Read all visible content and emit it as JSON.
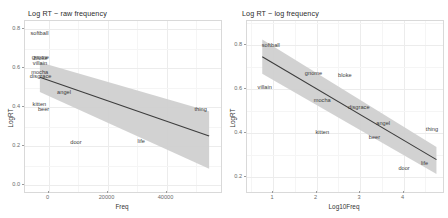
{
  "figure": {
    "background": "#ffffff",
    "ribbon_color": "#d0d0d0",
    "line_color": "#3d3d3d",
    "grid_color": "#ececec"
  },
  "chart_data": [
    {
      "type": "scatter",
      "panel": "left",
      "title": "Log RT ~ raw frequency",
      "xlabel": "Freq",
      "ylabel": "LogRT",
      "xlim": [
        -4000,
        62000
      ],
      "ylim": [
        -0.02,
        0.86
      ],
      "xticks": [
        0,
        20000,
        40000
      ],
      "xticklabels": [
        "0",
        "20000",
        "40000"
      ],
      "yticks": [
        0.0,
        0.2,
        0.4,
        0.6,
        0.8
      ],
      "yticklabels": [
        "0.0",
        "0.2",
        "0.4",
        "0.6",
        "0.8"
      ],
      "grid": true,
      "legend": "none",
      "point_labels": true,
      "points": [
        {
          "label": "softball",
          "x": 1200,
          "y": 0.795
        },
        {
          "label": "gnome",
          "x": 1500,
          "y": 0.672
        },
        {
          "label": "bloke",
          "x": 1700,
          "y": 0.662
        },
        {
          "label": "villain",
          "x": 1400,
          "y": 0.638
        },
        {
          "label": "mocha",
          "x": 1300,
          "y": 0.592
        },
        {
          "label": "disgrace",
          "x": 1600,
          "y": 0.57
        },
        {
          "label": "angel",
          "x": 9500,
          "y": 0.49
        },
        {
          "label": "kitten",
          "x": 1200,
          "y": 0.428
        },
        {
          "label": "beer",
          "x": 2600,
          "y": 0.4
        },
        {
          "label": "door",
          "x": 13500,
          "y": 0.232
        },
        {
          "label": "life",
          "x": 35500,
          "y": 0.238
        },
        {
          "label": "thing",
          "x": 55500,
          "y": 0.4
        }
      ],
      "fit": {
        "x0": 1000,
        "y0": 0.57,
        "x1": 58000,
        "y1": 0.268,
        "band_upper_y0": 0.648,
        "band_upper_y1": 0.395,
        "band_lower_y0": 0.494,
        "band_lower_y1": 0.1
      }
    },
    {
      "type": "scatter",
      "panel": "right",
      "title": "Log RT ~ log frequency",
      "xlabel": "Log10Freq",
      "ylabel": "LogRT",
      "xlim": [
        0.45,
        4.95
      ],
      "ylim": [
        0.16,
        0.9
      ],
      "xticks": [
        1,
        2,
        3,
        4
      ],
      "xticklabels": [
        "1",
        "2",
        "3",
        "4"
      ],
      "yticks": [
        0.2,
        0.4,
        0.6,
        0.8
      ],
      "yticklabels": [
        "0.2",
        "0.4",
        "0.6",
        "0.8"
      ],
      "grid": true,
      "legend": "none",
      "point_labels": true,
      "points": [
        {
          "label": "softball",
          "x": 1.02,
          "y": 0.792
        },
        {
          "label": "gnome",
          "x": 2.0,
          "y": 0.672
        },
        {
          "label": "bloke",
          "x": 2.72,
          "y": 0.66
        },
        {
          "label": "villain",
          "x": 0.88,
          "y": 0.608
        },
        {
          "label": "mocha",
          "x": 2.2,
          "y": 0.552
        },
        {
          "label": "disgrace",
          "x": 3.04,
          "y": 0.525
        },
        {
          "label": "angel",
          "x": 3.6,
          "y": 0.455
        },
        {
          "label": "kitten",
          "x": 2.2,
          "y": 0.415
        },
        {
          "label": "beer",
          "x": 3.4,
          "y": 0.392
        },
        {
          "label": "thing",
          "x": 4.72,
          "y": 0.428
        },
        {
          "label": "door",
          "x": 4.08,
          "y": 0.258
        },
        {
          "label": "life",
          "x": 4.55,
          "y": 0.283
        }
      ],
      "fit": {
        "x0": 0.8,
        "y0": 0.745,
        "x1": 4.8,
        "y1": 0.3,
        "band_upper_y0": 0.82,
        "band_upper_y1": 0.355,
        "band_lower_y0": 0.672,
        "band_lower_y1": 0.238
      }
    }
  ]
}
